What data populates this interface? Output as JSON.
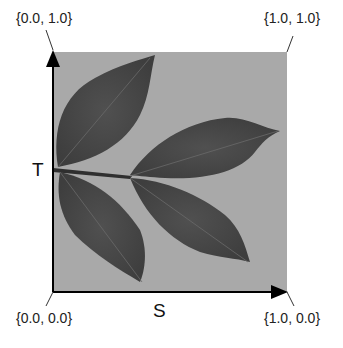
{
  "diagram": {
    "title": "",
    "corners": {
      "top_left": "{0.0, 1.0}",
      "top_right": "{1.0, 1.0}",
      "bottom_left": "{0.0, 0.0}",
      "bottom_right": "{1.0, 0.0}"
    },
    "axes": {
      "horizontal": "S",
      "vertical": "T"
    },
    "image": {
      "subject": "compound leaf with four leaflets",
      "background_color": "#a8a8a8",
      "leaf_color": "#4a4a4a"
    }
  }
}
